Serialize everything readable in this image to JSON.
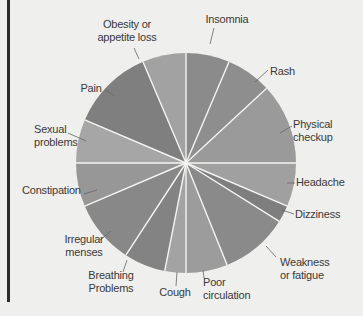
{
  "chart_data": {
    "type": "pie",
    "title": "",
    "start_angle_deg": 0,
    "direction": "clockwise",
    "unit": "percent (estimated from slice angles)",
    "categories": [
      "Insomnia",
      "Rash",
      "Physical checkup",
      "Headache",
      "Dizziness",
      "Weakness or fatigue",
      "Poor circulation",
      "Cough",
      "Breathing Problems",
      "Irregular menses",
      "Constipation",
      "Sexual problems",
      "Pain",
      "Obesity or appetite loss"
    ],
    "values": [
      6.4,
      6.7,
      11.9,
      6.4,
      2.5,
      10.0,
      6.1,
      3.1,
      6.1,
      9.4,
      6.4,
      6.4,
      12.2,
      6.4
    ],
    "colors": [
      "#8b8b8b",
      "#8e8e8e",
      "#9a9a9a",
      "#a0a0a0",
      "#7e7e7e",
      "#8a8a8a",
      "#9c9c9c",
      "#a3a3a3",
      "#838383",
      "#888888",
      "#979797",
      "#a6a6a6",
      "#7f7f7f",
      "#a2a2a2"
    ],
    "legend": "none (callout labels with leader lines)"
  },
  "labels": [
    {
      "lines": [
        "Insomnia"
      ]
    },
    {
      "lines": [
        "Rash"
      ]
    },
    {
      "lines": [
        "Physical",
        "checkup"
      ]
    },
    {
      "lines": [
        "Headache"
      ]
    },
    {
      "lines": [
        "Dizziness"
      ]
    },
    {
      "lines": [
        "Weakness",
        "or fatigue"
      ]
    },
    {
      "lines": [
        "Poor",
        "circulation"
      ]
    },
    {
      "lines": [
        "Cough"
      ]
    },
    {
      "lines": [
        "Breathing",
        "Problems"
      ]
    },
    {
      "lines": [
        "Irregular",
        "menses"
      ]
    },
    {
      "lines": [
        "Constipation"
      ]
    },
    {
      "lines": [
        "Sexual",
        "problems"
      ]
    },
    {
      "lines": [
        "Pain"
      ]
    },
    {
      "lines": [
        "Obesity or",
        "appetite loss"
      ]
    }
  ]
}
